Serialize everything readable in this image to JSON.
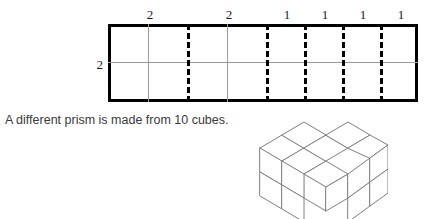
{
  "diagram": {
    "net": {
      "name": "rectangular-net",
      "rows": 2,
      "columns": 8,
      "side_label": "2",
      "top_labels": [
        "2",
        "2",
        "1",
        "1",
        "1",
        "1"
      ],
      "segment_widths": [
        2,
        2,
        1,
        1,
        1,
        1
      ],
      "border_color": "#000000",
      "gridline_color": "#9a9a9a",
      "divider_color": "#000000",
      "divider_style": "dashed"
    },
    "caption": "A different prism is made from 10 cubes.",
    "cube_model": {
      "name": "isometric-cube-stack",
      "cube_count": 10,
      "line_color": "#808080",
      "fill_color": "#ffffff"
    }
  }
}
